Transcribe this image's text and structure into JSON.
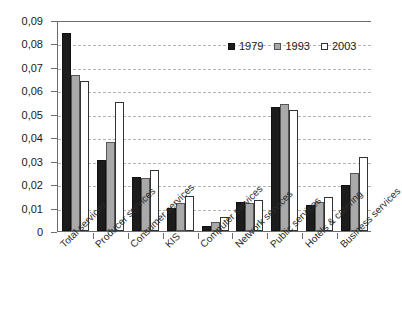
{
  "chart_data": {
    "type": "bar",
    "title": "",
    "subtitle": "",
    "xlabel": "",
    "ylabel": "",
    "ylim": [
      0,
      0.09
    ],
    "grid": true,
    "legend_position": "top-right",
    "decimal_separator": ",",
    "categories": [
      "Total services",
      "Producer services",
      "Consumer services",
      "KIS",
      "Computer services",
      "Network services",
      "Public services",
      "Hotels & catering",
      "Business services"
    ],
    "ytick_labels": [
      "0",
      "0,01",
      "0,02",
      "0,03",
      "0,04",
      "0,05",
      "0,06",
      "0,07",
      "0,08",
      "0,09"
    ],
    "ytick_values": [
      0,
      0.01,
      0.02,
      0.03,
      0.04,
      0.05,
      0.06,
      0.07,
      0.08,
      0.09
    ],
    "series": [
      {
        "name": "1979",
        "color": "#1c1c1c",
        "values": [
          0.0845,
          0.0305,
          0.023,
          0.0097,
          0.0023,
          0.0125,
          0.0528,
          0.0112,
          0.0198
        ]
      },
      {
        "name": "1993",
        "color": "#a9a9a9",
        "values": [
          0.0667,
          0.0378,
          0.0226,
          0.012,
          0.0039,
          0.012,
          0.0542,
          0.0122,
          0.0249
        ]
      },
      {
        "name": "2003",
        "color": "#ffffff",
        "values": [
          0.064,
          0.055,
          0.0262,
          0.015,
          0.006,
          0.0133,
          0.0517,
          0.0145,
          0.0315
        ]
      }
    ]
  },
  "legend": {
    "items": [
      {
        "label": "1979"
      },
      {
        "label": "1993"
      },
      {
        "label": "2003"
      }
    ]
  },
  "axes": {
    "y": {
      "max_label": "0,09",
      "min_label": "0"
    }
  }
}
